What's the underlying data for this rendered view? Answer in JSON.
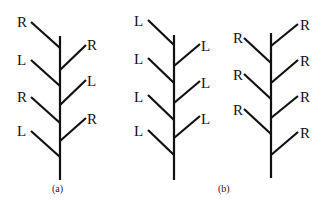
{
  "figure": {
    "trees": [
      {
        "id": "a",
        "caption": "(a)",
        "left_labels": [
          "R",
          "L",
          "R",
          "L"
        ],
        "right_labels": [
          "R",
          "L",
          "R"
        ]
      },
      {
        "id": "b1",
        "caption": "(b)",
        "left_labels": [
          "L",
          "L",
          "L",
          "L"
        ],
        "right_labels": [
          "L",
          "L",
          "L"
        ]
      },
      {
        "id": "b2",
        "caption": "",
        "left_labels": [
          "R",
          "R",
          "R"
        ],
        "right_labels": [
          "R",
          "R",
          "R",
          "R"
        ]
      }
    ]
  }
}
